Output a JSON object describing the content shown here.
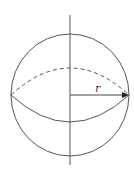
{
  "diagram": {
    "title": "",
    "type": "sphere-radius",
    "labels": {
      "radius": "r"
    },
    "colors": {
      "stroke": "#555555",
      "background": "#ffffff"
    },
    "geometry": {
      "center": [
        70,
        95
      ],
      "radius": 59,
      "equator_dashed_top_y": 68,
      "equator_solid_bottom_y": 122,
      "axis_top_y": 15,
      "axis_bottom_y": 165
    }
  }
}
